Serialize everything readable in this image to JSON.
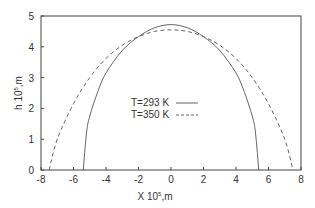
{
  "chart_data": {
    "type": "line",
    "title": "",
    "xlabel": "X 10^5,m",
    "xlabel_main": "X 10",
    "xlabel_sup": "5",
    "xlabel_unit": ",m",
    "ylabel": "h 10^5,m",
    "ylabel_main": "h 10",
    "ylabel_sup": "5",
    "ylabel_unit": ",m",
    "xlim": [
      -8,
      8
    ],
    "ylim": [
      0,
      5
    ],
    "xticks": [
      "-8",
      "-6",
      "-4",
      "-2",
      "0",
      "2",
      "4",
      "6",
      "8"
    ],
    "yticks": [
      "0",
      "1",
      "2",
      "3",
      "4",
      "5"
    ],
    "grid": false,
    "legend_position": "center",
    "series": [
      {
        "name": "T=293 K",
        "style": "solid",
        "color": "#555555",
        "x": [
          -5.4,
          -5.2,
          -5.0,
          -4.5,
          -4.0,
          -3.0,
          -2.0,
          -1.0,
          0.0,
          1.0,
          2.0,
          3.0,
          4.0,
          4.5,
          5.0,
          5.2,
          5.4
        ],
        "y": [
          0.0,
          1.2,
          1.75,
          2.55,
          3.15,
          3.88,
          4.33,
          4.62,
          4.72,
          4.62,
          4.33,
          3.88,
          3.15,
          2.55,
          1.75,
          1.2,
          0.0
        ]
      },
      {
        "name": "T=350 K",
        "style": "dashed",
        "color": "#555555",
        "x": [
          -7.5,
          -7.0,
          -6.0,
          -5.0,
          -4.0,
          -3.0,
          -2.0,
          -1.0,
          0.0,
          1.0,
          2.0,
          3.0,
          4.0,
          5.0,
          6.0,
          7.0,
          7.5
        ],
        "y": [
          0.0,
          1.0,
          2.15,
          3.0,
          3.62,
          4.05,
          4.33,
          4.5,
          4.55,
          4.5,
          4.33,
          4.05,
          3.62,
          3.0,
          2.15,
          1.0,
          0.0
        ]
      }
    ]
  }
}
